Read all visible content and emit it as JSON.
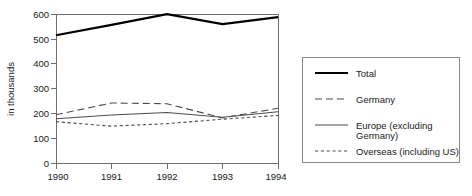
{
  "chart_data": {
    "type": "line",
    "title": "",
    "xlabel": "",
    "ylabel": "in thousands",
    "x": [
      "1990",
      "1991",
      "1992",
      "1993",
      "1994"
    ],
    "xtick_labels": [
      "1990",
      "1991",
      "1992",
      "1993",
      "1994"
    ],
    "ytick_labels": [
      "0",
      "100",
      "200",
      "300",
      "400",
      "500",
      "600"
    ],
    "yticks": [
      0,
      100,
      200,
      300,
      400,
      500,
      600
    ],
    "ylim": [
      0,
      600
    ],
    "grid": false,
    "legend_position": "right-outside",
    "series": [
      {
        "name": "Total",
        "style": "solid-thick",
        "color": "#000000",
        "values": [
          515,
          557,
          600,
          560,
          588
        ]
      },
      {
        "name": "Germany",
        "style": "long-dash",
        "color": "#4d4d4d",
        "values": [
          196,
          243,
          240,
          183,
          222
        ]
      },
      {
        "name": "Europe (excluding Germany)",
        "style": "solid-thin",
        "color": "#4d4d4d",
        "values": [
          180,
          195,
          205,
          186,
          208
        ]
      },
      {
        "name": "Overseas (including US)",
        "style": "short-dash",
        "color": "#4d4d4d",
        "values": [
          168,
          150,
          160,
          178,
          193
        ]
      }
    ]
  },
  "legend": {
    "items": [
      {
        "label": "Total",
        "swatch": "total-line-swatch"
      },
      {
        "label": "Germany",
        "swatch": "germany-line-swatch"
      },
      {
        "label": "Europe (excluding",
        "label2": "Germany)",
        "swatch": "europe-line-swatch"
      },
      {
        "label": "Overseas (including US)",
        "swatch": "overseas-line-swatch"
      }
    ]
  },
  "colors": {
    "total": "#000000",
    "series": "#4d4d4d",
    "axis": "#6e6e6e",
    "text": "#1a1a1a",
    "legend_border": "#8a8a8a",
    "background": "#ffffff"
  }
}
